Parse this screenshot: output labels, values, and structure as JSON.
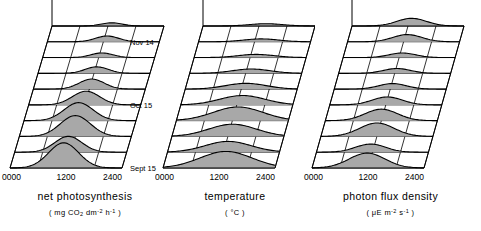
{
  "figure": {
    "background": "#ffffff",
    "ink": "#000000",
    "fill_color": "#a8a8a8",
    "date_labels": [
      "Sept 15",
      "Oct 15",
      "Nov 14"
    ],
    "n_traces": 10,
    "n_columns": 4
  },
  "chart_data": [
    {
      "type": "area",
      "id": "net-photosynthesis",
      "title": "net photosynthesis",
      "unit_prefix": "( mg CO",
      "unit_sub": "2",
      "unit_mid": " dm",
      "unit_sup1": "-2",
      "unit_mid2": " h",
      "unit_sup2": "-1",
      "unit_suffix": " )",
      "ylabel": "net photosynthesis",
      "ymax_label": "25",
      "ylim": [
        0,
        25
      ],
      "xlabel": "",
      "xticks": [
        "0000",
        "1200",
        "2400"
      ],
      "xtick_values": [
        0,
        1200,
        2400
      ],
      "xlim": [
        0,
        2400
      ],
      "zticks": [
        "Sept 15",
        "Oct 15",
        "Nov 14"
      ],
      "grid": true,
      "legend": "none",
      "series": [
        {
          "name": "trace-1",
          "date": "Sept 15",
          "peak_x": 1150,
          "peak_y": 17.5,
          "width": 520
        },
        {
          "name": "trace-2",
          "date": "",
          "peak_x": 1150,
          "peak_y": 11.0,
          "width": 470
        },
        {
          "name": "trace-3",
          "date": "",
          "peak_x": 1200,
          "peak_y": 14.5,
          "width": 520
        },
        {
          "name": "trace-4",
          "date": "",
          "peak_x": 1170,
          "peak_y": 12.5,
          "width": 500
        },
        {
          "name": "trace-5",
          "date": "Oct 15",
          "peak_x": 1230,
          "peak_y": 9.5,
          "width": 470
        },
        {
          "name": "trace-6",
          "date": "",
          "peak_x": 1250,
          "peak_y": 7.0,
          "width": 430
        },
        {
          "name": "trace-7",
          "date": "",
          "peak_x": 1260,
          "peak_y": 4.5,
          "width": 400
        },
        {
          "name": "trace-8",
          "date": "",
          "peak_x": 1270,
          "peak_y": 3.2,
          "width": 380
        },
        {
          "name": "trace-9",
          "date": "Nov 14",
          "peak_x": 1280,
          "peak_y": 4.0,
          "width": 400
        },
        {
          "name": "trace-10",
          "date": "",
          "peak_x": 1280,
          "peak_y": 2.2,
          "width": 360
        }
      ]
    },
    {
      "type": "area",
      "id": "temperature",
      "title": "temperature",
      "unit_prefix": "( ",
      "unit_sub": "",
      "unit_mid": "°C",
      "unit_sup1": "",
      "unit_mid2": "",
      "unit_sup2": "",
      "unit_suffix": " )",
      "ylabel": "temperature",
      "ymax_label": "25",
      "ylim": [
        0,
        25
      ],
      "xlabel": "",
      "xticks": [
        "0000",
        "1200",
        "2400"
      ],
      "xtick_values": [
        0,
        1200,
        2400
      ],
      "xlim": [
        0,
        2400
      ],
      "zticks": [
        "Sept 15",
        "Oct 15",
        "Nov 14"
      ],
      "grid": true,
      "legend": "none",
      "series": [
        {
          "name": "trace-1",
          "date": "Sept 15",
          "peak_x": 1350,
          "peak_y": 11.5,
          "width": 900
        },
        {
          "name": "trace-2",
          "date": "",
          "peak_x": 1300,
          "peak_y": 7.5,
          "width": 800
        },
        {
          "name": "trace-3",
          "date": "",
          "peak_x": 1300,
          "peak_y": 8.5,
          "width": 820
        },
        {
          "name": "trace-4",
          "date": "",
          "peak_x": 1320,
          "peak_y": 9.5,
          "width": 860
        },
        {
          "name": "trace-5",
          "date": "Oct 15",
          "peak_x": 1320,
          "peak_y": 6.5,
          "width": 780
        },
        {
          "name": "trace-6",
          "date": "",
          "peak_x": 1300,
          "peak_y": 4.0,
          "width": 700
        },
        {
          "name": "trace-7",
          "date": "",
          "peak_x": 1320,
          "peak_y": 3.0,
          "width": 650
        },
        {
          "name": "trace-8",
          "date": "",
          "peak_x": 1330,
          "peak_y": 2.2,
          "width": 620
        },
        {
          "name": "trace-9",
          "date": "Nov 14",
          "peak_x": 1340,
          "peak_y": 2.0,
          "width": 600
        },
        {
          "name": "trace-10",
          "date": "",
          "peak_x": 1350,
          "peak_y": 1.6,
          "width": 580
        }
      ]
    },
    {
      "type": "area",
      "id": "photon-flux-density",
      "title": "photon flux density",
      "unit_prefix": "( μE m",
      "unit_sub": "",
      "unit_mid": "",
      "unit_sup1": "-2",
      "unit_mid2": " s",
      "unit_sup2": "-1",
      "unit_suffix": " )",
      "ylabel": "photon flux density",
      "ymax_label": "1500",
      "ylim": [
        0,
        1500
      ],
      "xlabel": "",
      "xticks": [
        "0000",
        "1200",
        "2400"
      ],
      "xtick_values": [
        0,
        1200,
        2400
      ],
      "xlim": [
        0,
        2400
      ],
      "zticks": [
        "Sept 15",
        "Oct 15",
        "Nov 14"
      ],
      "grid": true,
      "legend": "none",
      "series": [
        {
          "name": "trace-1",
          "date": "Sept 15",
          "peak_x": 1180,
          "peak_y": 620,
          "width": 620
        },
        {
          "name": "trace-2",
          "date": "",
          "peak_x": 1160,
          "peak_y": 340,
          "width": 520
        },
        {
          "name": "trace-3",
          "date": "",
          "peak_x": 1200,
          "peak_y": 560,
          "width": 600
        },
        {
          "name": "trace-4",
          "date": "",
          "peak_x": 1200,
          "peak_y": 480,
          "width": 560
        },
        {
          "name": "trace-5",
          "date": "Oct 15",
          "peak_x": 1230,
          "peak_y": 330,
          "width": 520
        },
        {
          "name": "trace-6",
          "date": "",
          "peak_x": 1250,
          "peak_y": 230,
          "width": 480
        },
        {
          "name": "trace-7",
          "date": "",
          "peak_x": 1250,
          "peak_y": 200,
          "width": 470
        },
        {
          "name": "trace-8",
          "date": "",
          "peak_x": 1270,
          "peak_y": 190,
          "width": 460
        },
        {
          "name": "trace-9",
          "date": "Nov 14",
          "peak_x": 1280,
          "peak_y": 300,
          "width": 500
        },
        {
          "name": "trace-10",
          "date": "",
          "peak_x": 1280,
          "peak_y": 320,
          "width": 510
        }
      ]
    }
  ]
}
